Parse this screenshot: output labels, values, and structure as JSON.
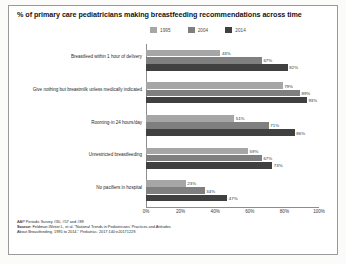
{
  "chart_data": {
    "type": "bar",
    "orientation": "horizontal",
    "title": "% of primary care pediatricians making breastfeeding recommendations across time",
    "xlabel": "",
    "ylabel": "",
    "xlim": [
      0,
      100
    ],
    "grid": false,
    "legend_position": "top-center",
    "categories": [
      "Breastfeed within 1 hour of delivery",
      "Give nothing but breastmilk unless medically indicated",
      "Rooming-in 24 hours/day",
      "Unrestricted breastfeeding",
      "No pacifiers in hospital"
    ],
    "series": [
      {
        "name": "1995",
        "color": "#a6a6a6",
        "values": [
          43,
          79,
          51,
          59,
          23
        ]
      },
      {
        "name": "2004",
        "color": "#7f7f7f",
        "values": [
          67,
          89,
          71,
          67,
          34
        ]
      },
      {
        "name": "2014",
        "color": "#404040",
        "values": [
          82,
          93,
          86,
          73,
          47
        ]
      }
    ],
    "value_labels": [
      [
        "43%",
        "67%",
        "82%"
      ],
      [
        "79%",
        "89%",
        "93%"
      ],
      [
        "51%",
        "71%",
        "86%"
      ],
      [
        "59%",
        "67%",
        "73%"
      ],
      [
        "23%",
        "34%",
        "47%"
      ]
    ],
    "xticks": [
      0,
      20,
      40,
      60,
      80,
      100
    ],
    "xtick_labels": [
      "0%",
      "20%",
      "40%",
      "60%",
      "80%",
      "100%"
    ]
  },
  "legend": {
    "items": [
      {
        "label": "1995",
        "color": "#a6a6a6"
      },
      {
        "label": "2004",
        "color": "#7f7f7f"
      },
      {
        "label": "2014",
        "color": "#404040"
      }
    ]
  },
  "footnotes": {
    "line1": "AAP Periodic Survey #30, #57 and #89",
    "line2_bold": "Source:",
    "line2_rest": " Feldman-Winter L, et al. “National Trends in Pediatricians’ Practices and Attitudes",
    "line3_plain": "About Breastfeeding. 1995 to 2014.” ",
    "line3_italic": "Pediatrics.",
    "line3_tail": " 2017;140:e20171229."
  },
  "colors": {
    "background": "#ffffff",
    "slide_background": "#fbfbf9",
    "frame_border": "#9a9a9a",
    "axis": "#8d8d8d",
    "text": "#1a1a1a",
    "series_1995": "#a6a6a6",
    "series_2004": "#7f7f7f",
    "series_2014": "#404040"
  }
}
